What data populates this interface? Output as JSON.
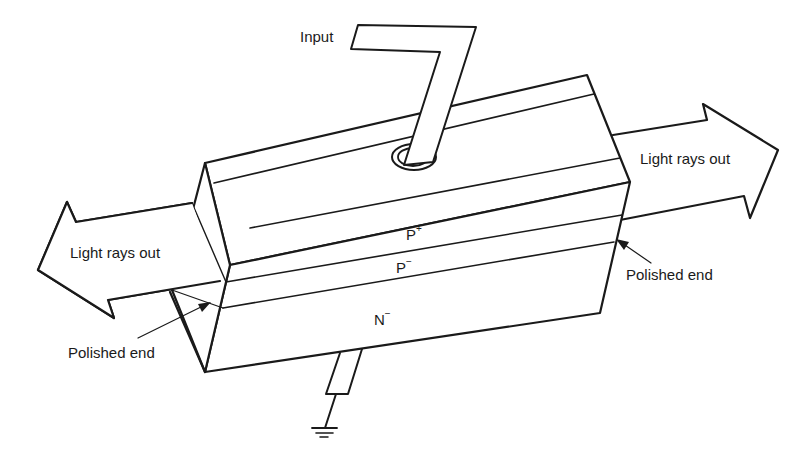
{
  "diagram": {
    "title": "",
    "labels": {
      "input": "Input",
      "light_left": "Light rays out",
      "light_right": "Light rays out",
      "polished_left": "Polished end",
      "polished_right": "Polished end"
    },
    "layers": [
      {
        "name": "P",
        "sup": "+"
      },
      {
        "name": "P",
        "sup": "−"
      },
      {
        "name": "N",
        "sup": "−"
      }
    ],
    "colors": {
      "line": "#1a1a1a",
      "background": "#ffffff"
    }
  }
}
